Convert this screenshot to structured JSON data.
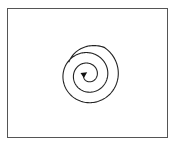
{
  "diagram": {
    "type": "spiral",
    "frame": {
      "stroke": "#555555"
    },
    "spiral": {
      "center": [
        88,
        75
      ],
      "turns": 3,
      "outer_radius": 32,
      "stroke": "#222222",
      "direction": "inward",
      "arrowhead": "center"
    }
  }
}
